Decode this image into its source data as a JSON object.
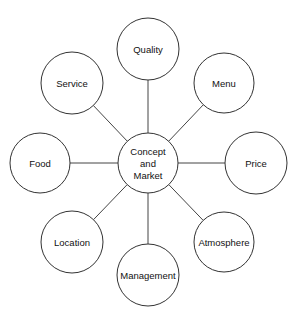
{
  "diagram": {
    "type": "hub-and-spoke",
    "center": {
      "id": "concept-and-market",
      "lines": [
        "Concept",
        "and",
        "Market"
      ],
      "cx": 148,
      "cy": 163,
      "r": 30
    },
    "nodes": [
      {
        "id": "quality",
        "label": "Quality",
        "cx": 148,
        "cy": 49,
        "r": 31
      },
      {
        "id": "menu",
        "label": "Menu",
        "cx": 224,
        "cy": 83,
        "r": 30
      },
      {
        "id": "price",
        "label": "Price",
        "cx": 256,
        "cy": 163,
        "r": 31
      },
      {
        "id": "atmosphere",
        "label": "Atmosphere",
        "cx": 224,
        "cy": 242,
        "r": 30
      },
      {
        "id": "management",
        "label": "Management",
        "cx": 148,
        "cy": 275,
        "r": 31
      },
      {
        "id": "location",
        "label": "Location",
        "cx": 72,
        "cy": 242,
        "r": 31
      },
      {
        "id": "food",
        "label": "Food",
        "cx": 40,
        "cy": 163,
        "r": 30
      },
      {
        "id": "service",
        "label": "Service",
        "cx": 72,
        "cy": 83,
        "r": 31
      }
    ],
    "edges": [
      {
        "from": "concept-and-market",
        "to": "quality"
      },
      {
        "from": "concept-and-market",
        "to": "menu"
      },
      {
        "from": "concept-and-market",
        "to": "price"
      },
      {
        "from": "concept-and-market",
        "to": "atmosphere"
      },
      {
        "from": "concept-and-market",
        "to": "management"
      },
      {
        "from": "concept-and-market",
        "to": "location"
      },
      {
        "from": "concept-and-market",
        "to": "food"
      },
      {
        "from": "concept-and-market",
        "to": "service"
      }
    ]
  }
}
